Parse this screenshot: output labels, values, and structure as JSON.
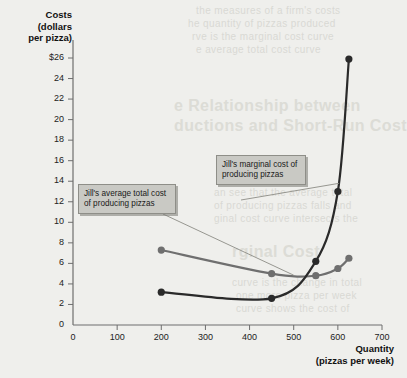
{
  "background_text": {
    "top_lines": [
      "the measures of a firm's costs",
      "he quantity of pizzas produced",
      "rve is the marginal cost curve",
      "e average total cost curve"
    ],
    "heading": "e Relationship between\nductions and Short-Run Cost",
    "mid_lines": [
      "an see that the average total",
      "of producing pizzas falls and",
      "ginal cost curve intersects the"
    ],
    "lower_heading": "rginal Cost",
    "lower_lines": [
      "curve is the change in total",
      "one more pizza per week",
      "curve shows the cost of"
    ]
  },
  "chart_data": {
    "type": "line",
    "title": "",
    "xlabel": "Quantity",
    "xlabel_sub": "(pizzas per week)",
    "ylabel": "Costs",
    "ylabel_sub_1": "(dollars",
    "ylabel_sub_2": "per pizza)",
    "xlim": [
      0,
      700
    ],
    "ylim": [
      0,
      26
    ],
    "grid": false,
    "legend_position": "annotation-callouts",
    "xticks": [
      0,
      100,
      200,
      300,
      400,
      500,
      600,
      700
    ],
    "xtick_labels": [
      "0",
      "100",
      "200",
      "300",
      "400",
      "500",
      "600",
      "700"
    ],
    "yticks": [
      0,
      2,
      4,
      6,
      8,
      10,
      12,
      14,
      16,
      18,
      20,
      22,
      24,
      26
    ],
    "ytick_labels": [
      "0",
      "2",
      "4",
      "6",
      "8",
      "10",
      "12",
      "14",
      "16",
      "18",
      "20",
      "22",
      "24",
      "$26"
    ],
    "series": [
      {
        "name": "Jill's average total cost of producing pizzas",
        "key": "atc",
        "color": "#6f6f6f",
        "marker": "filled-circle",
        "points": [
          {
            "x": 200,
            "y": 7.3
          },
          {
            "x": 450,
            "y": 5.0
          },
          {
            "x": 550,
            "y": 4.8
          },
          {
            "x": 600,
            "y": 5.5
          },
          {
            "x": 625,
            "y": 6.5
          }
        ]
      },
      {
        "name": "Jill's marginal cost of producing pizzas",
        "key": "mc",
        "color": "#2a2a2a",
        "marker": "filled-circle",
        "points": [
          {
            "x": 200,
            "y": 3.2
          },
          {
            "x": 450,
            "y": 2.6
          },
          {
            "x": 550,
            "y": 6.2
          },
          {
            "x": 600,
            "y": 13.0
          },
          {
            "x": 625,
            "y": 25.9
          }
        ]
      }
    ],
    "annotations": [
      {
        "key": "atc",
        "text": "Jill's average total cost of producing pizzas",
        "target_x": 500,
        "target_y": 4.85
      },
      {
        "key": "mc",
        "text": "Jill's marginal cost of producing pizzas",
        "target_x": 603,
        "target_y": 13.8
      }
    ]
  }
}
